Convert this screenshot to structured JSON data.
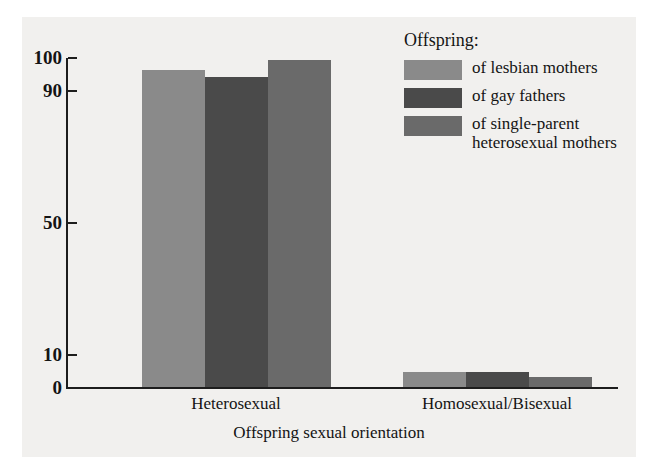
{
  "chart_data": {
    "type": "bar",
    "title": "",
    "xlabel": "Offspring sexual orientation",
    "ylabel": "",
    "categories": [
      "Heterosexual",
      "Homosexual/Bisexual"
    ],
    "series": [
      {
        "name": "of lesbian mothers",
        "color": "#8a8a8a",
        "values": [
          96,
          4.5
        ]
      },
      {
        "name": "of gay fathers",
        "color": "#4a4a4a",
        "values": [
          94,
          4.5
        ]
      },
      {
        "name": "of single-parent heterosexual mothers",
        "color": "#6a6a6a",
        "values": [
          99,
          3
        ]
      }
    ],
    "ylim": [
      0,
      100
    ],
    "yticks": [
      0,
      10,
      50,
      90,
      100
    ],
    "ytick_labels": [
      "0",
      "10",
      "50",
      "90",
      "100"
    ],
    "grid": false,
    "legend_position": "top-right",
    "legend_title": "Offspring:"
  },
  "legend": {
    "title": "Offspring:",
    "entries": [
      {
        "label": "of lesbian mothers"
      },
      {
        "label": "of gay fathers"
      },
      {
        "label": "of single-parent heterosexual mothers"
      }
    ]
  },
  "axes": {
    "x_title": "Offspring sexual orientation",
    "x_categories": [
      "Heterosexual",
      "Homosexual/Bisexual"
    ],
    "y_tick_labels": [
      "100",
      "90",
      "50",
      "10",
      "0"
    ]
  },
  "colors": {
    "series_1": "#8a8a8a",
    "series_2": "#4a4a4a",
    "series_3": "#6a6a6a",
    "axis": "#1d1d1d",
    "background": "#f1f0ee",
    "page": "#ffffff"
  }
}
